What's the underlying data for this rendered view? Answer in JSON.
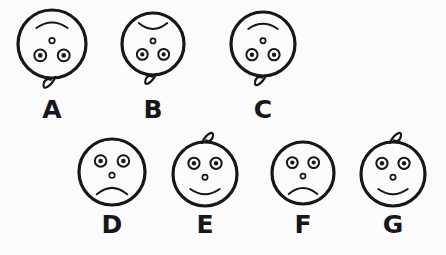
{
  "page": {
    "background_color": "#fbfbfb",
    "ink_color": "#17171b",
    "width": 446,
    "height": 255
  },
  "rows": [
    {
      "name": "top-row",
      "orientation": "inverted",
      "description": "Faces drawn upside down with hair curl pointing downward"
    },
    {
      "name": "bottom-row",
      "orientation": "upright",
      "description": "Faces drawn upright with hair curl pointing upward"
    }
  ],
  "figures": [
    {
      "id": "A",
      "label": "A",
      "row": "top-row",
      "orientation": "inverted",
      "mouth": "arc-up",
      "mouth_meaning": "frown",
      "has_curl": true,
      "curl_position": "bottom",
      "eyes": 2,
      "nose": "small-circle",
      "cx": 52,
      "cy": 44,
      "r": 34,
      "label_x": 52,
      "label_y": 97
    },
    {
      "id": "B",
      "label": "B",
      "row": "top-row",
      "orientation": "inverted",
      "mouth": "arc-down",
      "mouth_meaning": "smile",
      "has_curl": true,
      "curl_position": "bottom",
      "eyes": 2,
      "nose": "small-circle",
      "cx": 153,
      "cy": 44,
      "r": 31,
      "label_x": 153,
      "label_y": 97
    },
    {
      "id": "C",
      "label": "C",
      "row": "top-row",
      "orientation": "inverted",
      "mouth": "arc-up",
      "mouth_meaning": "frown",
      "has_curl": true,
      "curl_position": "bottom",
      "eyes": 2,
      "nose": "small-circle",
      "cx": 263,
      "cy": 44,
      "r": 32,
      "label_x": 263,
      "label_y": 97
    },
    {
      "id": "D",
      "label": "D",
      "row": "bottom-row",
      "orientation": "upright",
      "mouth": "arc-down",
      "mouth_meaning": "frown",
      "has_curl": false,
      "curl_position": "none",
      "eyes": 2,
      "nose": "small-circle",
      "cx": 112,
      "cy": 172,
      "r": 33,
      "label_x": 112,
      "label_y": 212
    },
    {
      "id": "E",
      "label": "E",
      "row": "bottom-row",
      "orientation": "upright",
      "mouth": "arc-up",
      "mouth_meaning": "smile",
      "has_curl": true,
      "curl_position": "top",
      "eyes": 2,
      "nose": "small-circle",
      "cx": 205,
      "cy": 174,
      "r": 32,
      "label_x": 205,
      "label_y": 212
    },
    {
      "id": "F",
      "label": "F",
      "row": "bottom-row",
      "orientation": "upright",
      "mouth": "arc-down",
      "mouth_meaning": "frown",
      "has_curl": false,
      "curl_position": "none",
      "eyes": 2,
      "nose": "small-circle",
      "cx": 303,
      "cy": 173,
      "r": 31,
      "label_x": 303,
      "label_y": 212
    },
    {
      "id": "G",
      "label": "G",
      "row": "bottom-row",
      "orientation": "upright",
      "mouth": "arc-up",
      "mouth_meaning": "smile",
      "has_curl": true,
      "curl_position": "top",
      "eyes": 2,
      "nose": "small-circle",
      "cx": 393,
      "cy": 174,
      "r": 32,
      "label_x": 393,
      "label_y": 212
    }
  ],
  "label_style": {
    "font_size_px": 25,
    "weight": "bold"
  }
}
